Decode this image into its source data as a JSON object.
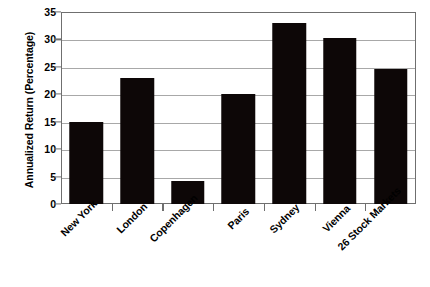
{
  "chart_data": {
    "type": "bar",
    "title": "",
    "subtitle": "",
    "xlabel": "",
    "ylabel": "Annualized Return (Percentage)",
    "categories": [
      "New York",
      "London",
      "Copenhagen",
      "Paris",
      "Sydney",
      "Vienna",
      "26 Stock Markets"
    ],
    "values": [
      15.0,
      22.9,
      4.2,
      20.0,
      33.0,
      30.3,
      24.6
    ],
    "series": [
      {
        "name": "Annualized Return",
        "values": [
          15.0,
          22.9,
          4.2,
          20.0,
          33.0,
          30.3,
          24.6
        ]
      }
    ],
    "ylim": [
      0,
      35
    ],
    "ytick_labels": [
      "0",
      "5",
      "10",
      "15",
      "20",
      "25",
      "30",
      "35"
    ],
    "ytick_values": [
      0,
      5,
      10,
      15,
      20,
      25,
      30,
      35
    ],
    "grid": true,
    "grid_axis": "y",
    "legend": false,
    "legend_position": "none",
    "bar_color": "#0d0707",
    "grid_color": "#a8a8a8",
    "frame_color": "#6f6f6f",
    "background_color": "#ffffff",
    "xtick_label_rotation": 45
  }
}
